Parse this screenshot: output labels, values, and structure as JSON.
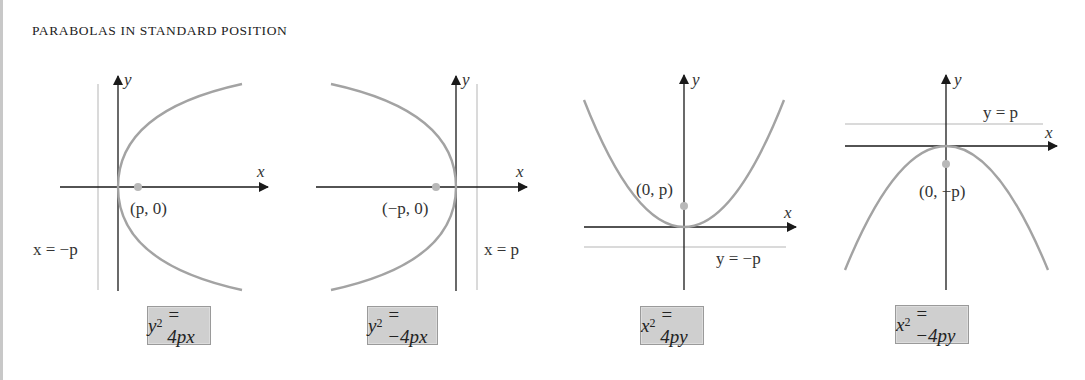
{
  "title": "PARABOLAS IN STANDARD POSITION",
  "diagrams": [
    {
      "id": "right-opening",
      "axis_x_label": "x",
      "axis_y_label": "y",
      "focus_label": "(p, 0)",
      "directrix_label": "x = −p",
      "equation": {
        "lhs_var": "y",
        "exp": "2",
        "rhs": "= 4px"
      }
    },
    {
      "id": "left-opening",
      "axis_x_label": "x",
      "axis_y_label": "y",
      "focus_label": "(−p, 0)",
      "directrix_label": "x = p",
      "equation": {
        "lhs_var": "y",
        "exp": "2",
        "rhs": "= −4px"
      }
    },
    {
      "id": "up-opening",
      "axis_x_label": "x",
      "axis_y_label": "y",
      "focus_label": "(0, p)",
      "directrix_label": "y = −p",
      "equation": {
        "lhs_var": "x",
        "exp": "2",
        "rhs": "= 4py"
      }
    },
    {
      "id": "down-opening",
      "axis_x_label": "x",
      "axis_y_label": "y",
      "focus_label": "(0, −p)",
      "directrix_label": "y = p",
      "equation": {
        "lhs_var": "x",
        "exp": "2",
        "rhs": "= −4py"
      }
    }
  ],
  "colors": {
    "curve": "#a3a3a3",
    "axis": "#1a1a1a",
    "directrix": "#b5b5b5",
    "focus": "#b8b8b8",
    "equation_box": "#cfcfcf"
  }
}
